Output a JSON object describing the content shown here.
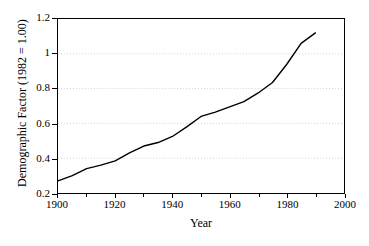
{
  "chart_data": {
    "type": "line",
    "title": "",
    "xlabel": "Year",
    "ylabel": "Demographic Factor (1982 = 1.00)",
    "xlim": [
      1900,
      2000
    ],
    "ylim": [
      0.2,
      1.2
    ],
    "grid": true,
    "grid_style": "dotted-light",
    "legend": "none",
    "line_color": "#000000",
    "x_tick_labels": [
      "1900",
      "1920",
      "1940",
      "1960",
      "1980",
      "2000"
    ],
    "x_ticks": [
      1900,
      1920,
      1940,
      1960,
      1980,
      2000
    ],
    "x_minor_ticks": [
      1910,
      1930,
      1950,
      1970,
      1990
    ],
    "y_tick_labels": [
      "0.2",
      "0.4",
      "0.6",
      "0.8",
      "1",
      "1.2"
    ],
    "y_ticks": [
      0.2,
      0.4,
      0.6,
      0.8,
      1.0,
      1.2
    ],
    "series": [
      {
        "name": "Demographic Factor",
        "x": [
          1900,
          1905,
          1910,
          1915,
          1920,
          1925,
          1930,
          1935,
          1940,
          1945,
          1950,
          1955,
          1960,
          1965,
          1970,
          1975,
          1980,
          1985,
          1990
        ],
        "values": [
          0.27,
          0.3,
          0.34,
          0.36,
          0.385,
          0.43,
          0.47,
          0.49,
          0.525,
          0.58,
          0.64,
          0.665,
          0.695,
          0.725,
          0.775,
          0.835,
          0.94,
          1.06,
          1.12
        ]
      }
    ]
  }
}
